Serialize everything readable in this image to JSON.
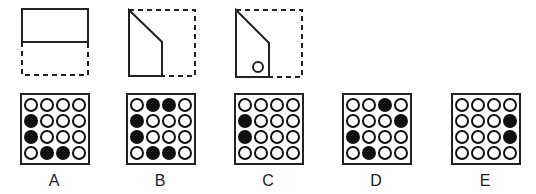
{
  "puzzle": {
    "type": "paper-folding",
    "steps": [
      {
        "id": "fold-1",
        "description": "square folded bottom half up onto top half"
      },
      {
        "id": "fold-2",
        "description": "top-right corner folded diagonally and right part folded over"
      },
      {
        "id": "punch",
        "description": "hole punched near bottom"
      }
    ]
  },
  "options": [
    {
      "label": "A",
      "grid": [
        [
          0,
          0,
          0,
          0
        ],
        [
          1,
          0,
          0,
          0
        ],
        [
          1,
          0,
          0,
          0
        ],
        [
          0,
          1,
          1,
          0
        ]
      ]
    },
    {
      "label": "B",
      "grid": [
        [
          0,
          1,
          1,
          0
        ],
        [
          1,
          0,
          0,
          0
        ],
        [
          1,
          0,
          0,
          0
        ],
        [
          0,
          1,
          1,
          0
        ]
      ]
    },
    {
      "label": "C",
      "grid": [
        [
          0,
          0,
          0,
          0
        ],
        [
          1,
          0,
          0,
          0
        ],
        [
          1,
          0,
          0,
          0
        ],
        [
          0,
          0,
          0,
          0
        ]
      ]
    },
    {
      "label": "D",
      "grid": [
        [
          0,
          0,
          1,
          0
        ],
        [
          0,
          0,
          0,
          1
        ],
        [
          1,
          0,
          0,
          0
        ],
        [
          0,
          1,
          0,
          0
        ]
      ]
    },
    {
      "label": "E",
      "grid": [
        [
          0,
          0,
          0,
          0
        ],
        [
          0,
          0,
          0,
          1
        ],
        [
          0,
          0,
          0,
          1
        ],
        [
          0,
          0,
          0,
          0
        ]
      ]
    }
  ],
  "colors": {
    "stroke": "#222222",
    "filled": "#111111",
    "background": "#ffffff"
  }
}
